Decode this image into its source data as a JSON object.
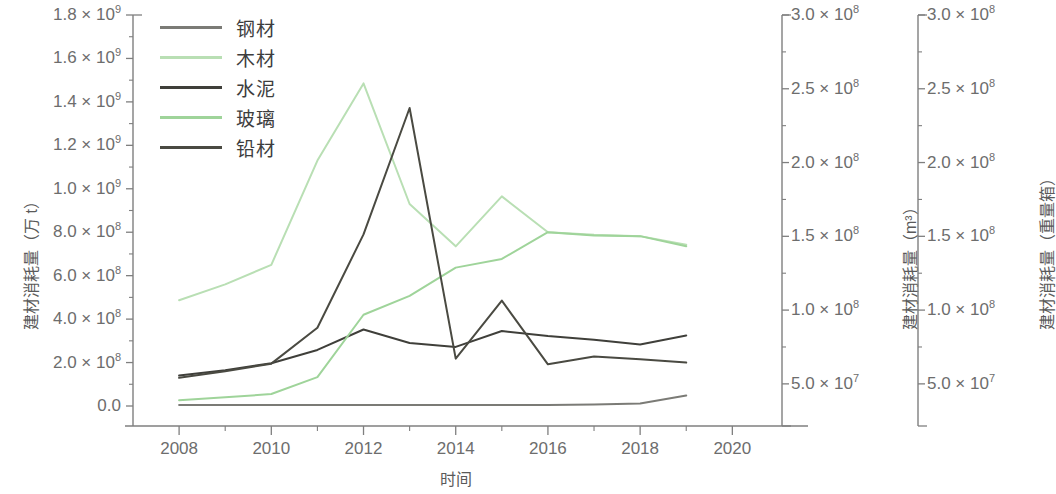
{
  "figure": {
    "xlabel": "时间",
    "left_axis_title": "建材消耗量（万 t）",
    "right_axis_1_title": "建材消耗量（m³）",
    "right_axis_2_title": "建材消耗量（重量箱）"
  },
  "legend": {
    "items": [
      {
        "label": "钢材",
        "color": "#7b7b76"
      },
      {
        "label": "木材",
        "color": "#b9dfb4"
      },
      {
        "label": "水泥",
        "color": "#3f3f3a"
      },
      {
        "label": "玻璃",
        "color": "#9fd49a"
      },
      {
        "label": "铅材",
        "color": "#4a4a42"
      }
    ]
  },
  "axes": {
    "x": {
      "ticks": [
        "2008",
        "2010",
        "2012",
        "2014",
        "2016",
        "2018",
        "2020"
      ],
      "tick_values": [
        2008,
        2010,
        2012,
        2014,
        2016,
        2018,
        2020
      ],
      "minor_step": 1,
      "range": [
        2007.0,
        2020.6
      ]
    },
    "left": {
      "ticks": [
        "0.0",
        "2.0 × 10⁸",
        "4.0 × 10⁸",
        "6.0 × 10⁸",
        "8.0 × 10⁸",
        "1.0 × 10⁹",
        "1.2 × 10⁹",
        "1.4 × 10⁹",
        "1.6 × 10⁹",
        "1.8 × 10⁹"
      ],
      "tick_values": [
        0,
        200000000,
        400000000,
        600000000,
        800000000,
        1000000000,
        1200000000,
        1400000000,
        1600000000,
        1800000000
      ],
      "range": [
        0,
        1800000000
      ]
    },
    "right1": {
      "ticks": [
        "5.0 × 10⁷",
        "1.0 × 10⁸",
        "1.5 × 10⁸",
        "2.0 × 10⁸",
        "2.5 × 10⁸",
        "3.0 × 10⁸"
      ],
      "tick_values": [
        50000000,
        100000000,
        150000000,
        200000000,
        250000000,
        300000000
      ],
      "range": [
        35000000,
        300000000
      ]
    },
    "right2": {
      "ticks": [
        "5.0 × 10⁷",
        "1.0 × 10⁸",
        "1.5 × 10⁸",
        "2.0 × 10⁸",
        "2.5 × 10⁸",
        "3.0 × 10⁸"
      ],
      "tick_values": [
        50000000,
        100000000,
        150000000,
        200000000,
        250000000,
        300000000
      ],
      "range": [
        35000000,
        300000000
      ]
    }
  },
  "chart_data": {
    "type": "line",
    "title": "",
    "xlabel": "时间",
    "ylabel": "建材消耗量（万 t）",
    "grid": false,
    "legend_position": "top-left",
    "x": [
      2008,
      2009,
      2010,
      2011,
      2012,
      2013,
      2014,
      2015,
      2016,
      2017,
      2018,
      2019
    ],
    "series": [
      {
        "name": "钢材",
        "color": "#7b7b76",
        "axis": "left",
        "values": [
          5000000,
          5000000,
          5000000,
          5000000,
          5000000,
          5000000,
          5000000,
          5000000,
          5000000,
          7000000,
          12000000,
          48000000
        ]
      },
      {
        "name": "木材",
        "color": "#b9dfb4",
        "axis": "left",
        "values": [
          487000000,
          560000000,
          650000000,
          1130000000,
          1485000000,
          930000000,
          735000000,
          965000000,
          800000000,
          788000000,
          782000000,
          742000000
        ]
      },
      {
        "name": "水泥",
        "color": "#3f3f3a",
        "axis": "left",
        "values": [
          140000000,
          165000000,
          197000000,
          258000000,
          352000000,
          290000000,
          272000000,
          345000000,
          322000000,
          305000000,
          283000000,
          325000000
        ]
      },
      {
        "name": "玻璃",
        "color": "#9fd49a",
        "axis": "left",
        "values": [
          27000000,
          40000000,
          55000000,
          133000000,
          420000000,
          507000000,
          637000000,
          677000000,
          800000000,
          785000000,
          782000000,
          735000000
        ]
      },
      {
        "name": "铅材",
        "color": "#4a4a42",
        "axis": "left",
        "values": [
          130000000,
          160000000,
          195000000,
          360000000,
          790000000,
          1372000000,
          218000000,
          485000000,
          192000000,
          228000000,
          215000000,
          200000000
        ]
      }
    ]
  }
}
